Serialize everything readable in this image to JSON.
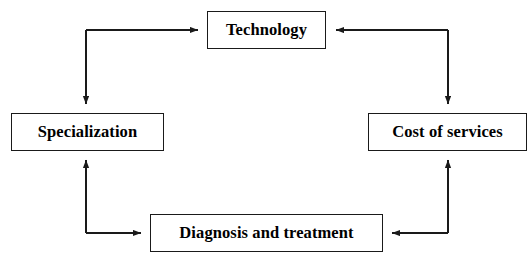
{
  "figure": {
    "type": "cycle-diagram",
    "caption_fragment": "",
    "background_color": "#ffffff",
    "line_color": "#1a1a1a",
    "text_color": "#000000",
    "box_border_color": "#1a1a1a",
    "width": 529,
    "height": 266
  },
  "nodes": [
    {
      "id": "technology",
      "label": "Technology",
      "position": "top"
    },
    {
      "id": "specialization",
      "label": "Specialization",
      "position": "left"
    },
    {
      "id": "cost_of_services",
      "label": "Cost of services",
      "position": "right"
    },
    {
      "id": "diagnosis_and_treatment",
      "label": "Diagnosis and treatment",
      "position": "bottom"
    }
  ],
  "connectors": [
    {
      "id": "top-left-connector",
      "from": "corner",
      "shape": "elbow",
      "arrow_targets": [
        "technology",
        "specialization"
      ]
    },
    {
      "id": "top-right-connector",
      "from": "corner",
      "shape": "elbow",
      "arrow_targets": [
        "technology",
        "cost_of_services"
      ]
    },
    {
      "id": "bottom-left-connector",
      "from": "corner",
      "shape": "elbow",
      "arrow_targets": [
        "specialization",
        "diagnosis_and_treatment"
      ]
    },
    {
      "id": "bottom-right-connector",
      "from": "corner",
      "shape": "elbow",
      "arrow_targets": [
        "cost_of_services",
        "diagnosis_and_treatment"
      ]
    }
  ]
}
